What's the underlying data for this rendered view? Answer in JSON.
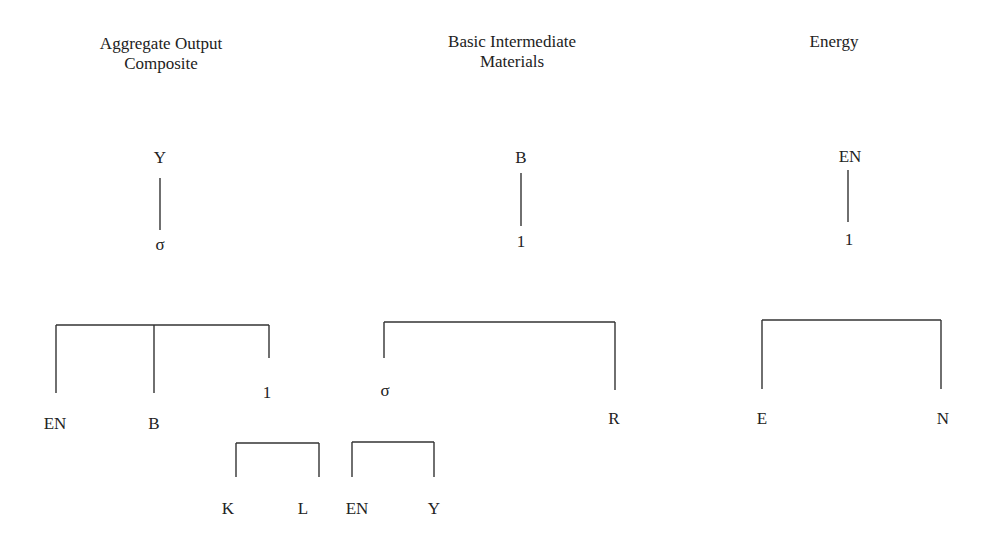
{
  "panels": [
    {
      "title_lines": [
        "Aggregate Output",
        "Composite"
      ],
      "root": "Y",
      "elasticity": "σ",
      "children": [
        "EN",
        "B",
        "1"
      ],
      "sub_nest": {
        "elasticity": "1",
        "children": [
          "K",
          "L"
        ]
      }
    },
    {
      "title_lines": [
        "Basic Intermediate",
        "Materials"
      ],
      "root": "B",
      "elasticity": "1",
      "children": [
        "σ",
        "R"
      ],
      "sub_nest": {
        "elasticity": "σ",
        "children": [
          "EN",
          "Y"
        ]
      }
    },
    {
      "title_lines": [
        "Energy"
      ],
      "root": "EN",
      "elasticity": "1",
      "children": [
        "E",
        "N"
      ]
    }
  ],
  "colors": {
    "line": "#333333",
    "text": "#222222",
    "background": "#ffffff"
  }
}
